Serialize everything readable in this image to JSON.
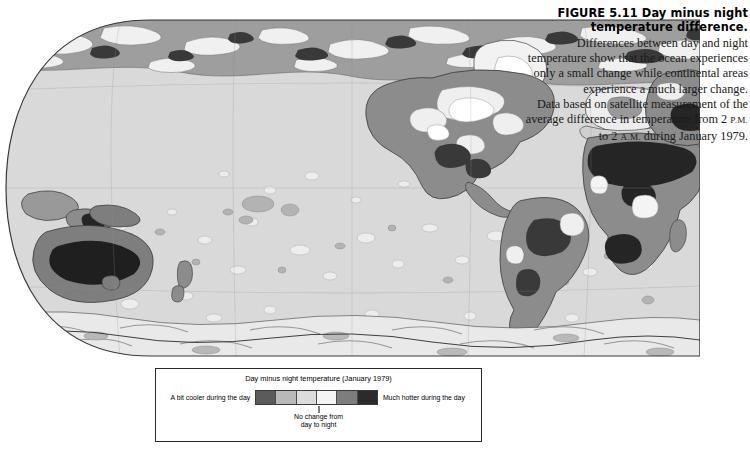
{
  "figure": {
    "caption_title": "FIGURE 5.11  Day minus night temperature difference.",
    "caption_body_1": "Differences between day and night temperature show that the ocean experiences only a small change while continental areas experience a much larger change.",
    "caption_body_2_pre": "Data based on satellite measurement of the average difference in temperature from 2 ",
    "caption_pm": "P.M.",
    "caption_body_2_mid": " to 2 ",
    "caption_am": "A.M.",
    "caption_body_2_post": " during January 1979."
  },
  "legend": {
    "title": "Day minus night temperature (January 1979)",
    "left_label": "A bit cooler during the day",
    "right_label": "Much hotter during the day",
    "mid_label_line1": "No change from",
    "mid_label_line2": "day to night",
    "swatches": [
      {
        "name": "a-bit-cooler",
        "color": "#5b5b5b"
      },
      {
        "name": "slightly-cooler",
        "color": "#b9b9b9"
      },
      {
        "name": "no-change",
        "color": "#dcdcdc"
      },
      {
        "name": "slightly-hotter",
        "color": "#f4f4f4"
      },
      {
        "name": "hotter",
        "color": "#7d7d7d"
      },
      {
        "name": "much-hotter",
        "color": "#2b2b2b"
      }
    ]
  },
  "map": {
    "projection": "robinson",
    "ocean_color": "#d9d9d9",
    "outline_color": "#555555",
    "graticule_color": "#8a8a8a",
    "class_colors": {
      "cooler": "#9a9a9a",
      "no_change": "#d9d9d9",
      "slight": "#efefef",
      "warm": "#ffffff",
      "hot": "#8c8c8c",
      "very_hot": "#2f2f2f"
    },
    "regions": [
      {
        "name": "north-america",
        "class": "hot"
      },
      {
        "name": "south-america",
        "class": "hot"
      },
      {
        "name": "africa-sahara",
        "class": "very_hot"
      },
      {
        "name": "africa-south",
        "class": "hot"
      },
      {
        "name": "europe",
        "class": "slight"
      },
      {
        "name": "asia-central",
        "class": "hot"
      },
      {
        "name": "arabia",
        "class": "very_hot"
      },
      {
        "name": "australia-interior",
        "class": "very_hot"
      },
      {
        "name": "australia-coast",
        "class": "hot"
      },
      {
        "name": "greenland",
        "class": "warm"
      },
      {
        "name": "antarctica",
        "class": "warm"
      },
      {
        "name": "ocean-pacific",
        "class": "no_change"
      },
      {
        "name": "ocean-atlantic",
        "class": "no_change"
      },
      {
        "name": "ocean-indian",
        "class": "no_change"
      }
    ]
  }
}
